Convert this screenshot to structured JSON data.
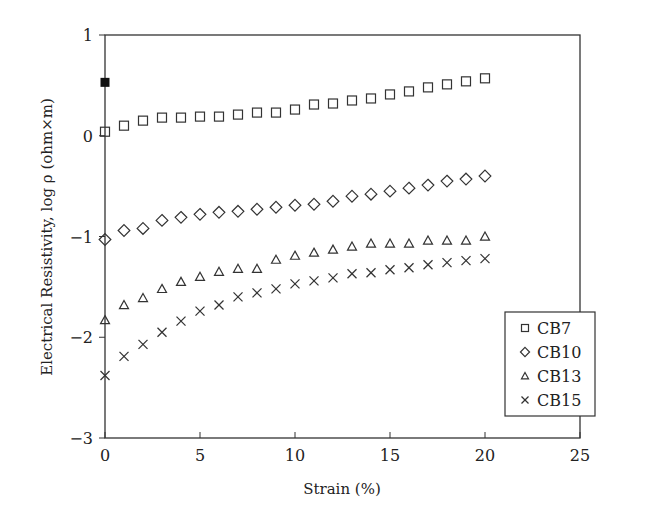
{
  "chart_data": {
    "type": "scatter",
    "title": "",
    "xlabel": "Strain (%)",
    "ylabel": "Electrical Resistivity, log ρ (ohm×m)",
    "xlim": [
      0,
      25
    ],
    "ylim": [
      -3,
      1
    ],
    "xticks": [
      0,
      5,
      10,
      15,
      20,
      25
    ],
    "yticks": [
      1,
      0,
      -1,
      -2,
      -3
    ],
    "ytick_labels": [
      "1",
      "0",
      "−1",
      "−2",
      "−3"
    ],
    "grid": false,
    "legend_position": "lower right",
    "x": [
      0,
      1,
      2,
      3,
      4,
      5,
      6,
      7,
      8,
      9,
      10,
      11,
      12,
      13,
      14,
      15,
      16,
      17,
      18,
      19,
      20
    ],
    "series": [
      {
        "name": "CB7",
        "marker": "square",
        "values": [
          0.04,
          0.1,
          0.15,
          0.18,
          0.18,
          0.19,
          0.19,
          0.21,
          0.23,
          0.23,
          0.26,
          0.31,
          0.32,
          0.35,
          0.37,
          0.41,
          0.44,
          0.48,
          0.51,
          0.54,
          0.57
        ]
      },
      {
        "name": "CB10",
        "marker": "diamond",
        "values": [
          -1.03,
          -0.94,
          -0.92,
          -0.84,
          -0.81,
          -0.78,
          -0.76,
          -0.75,
          -0.73,
          -0.71,
          -0.69,
          -0.68,
          -0.65,
          -0.6,
          -0.58,
          -0.55,
          -0.52,
          -0.49,
          -0.45,
          -0.43,
          -0.4
        ]
      },
      {
        "name": "CB13",
        "marker": "triangle",
        "values": [
          -1.83,
          -1.68,
          -1.61,
          -1.52,
          -1.45,
          -1.4,
          -1.35,
          -1.32,
          -1.32,
          -1.23,
          -1.19,
          -1.16,
          -1.13,
          -1.1,
          -1.07,
          -1.07,
          -1.07,
          -1.04,
          -1.04,
          -1.04,
          -1.0
        ]
      },
      {
        "name": "CB15",
        "marker": "x",
        "values": [
          -2.38,
          -2.19,
          -2.07,
          -1.95,
          -1.84,
          -1.74,
          -1.68,
          -1.6,
          -1.56,
          -1.52,
          -1.47,
          -1.44,
          -1.41,
          -1.37,
          -1.36,
          -1.33,
          -1.31,
          -1.28,
          -1.26,
          -1.24,
          -1.22
        ]
      }
    ],
    "annotations": [
      {
        "type": "filled-square",
        "x": 0,
        "y": 0.53
      }
    ]
  }
}
